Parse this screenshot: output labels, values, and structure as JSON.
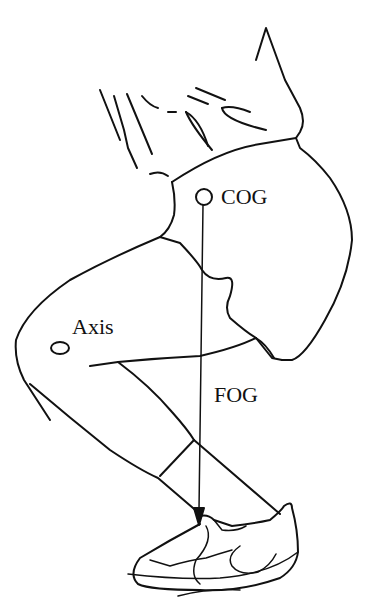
{
  "figure": {
    "type": "biomechanics line drawing",
    "labels": {
      "cog": "COG",
      "axis": "Axis",
      "fog": "FOG"
    },
    "colors": {
      "background": "#ffffff",
      "ink": "#111111"
    }
  }
}
